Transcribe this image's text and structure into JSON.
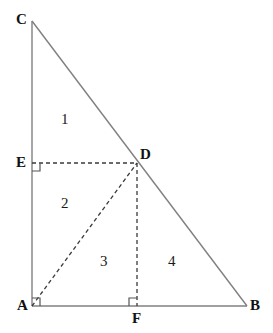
{
  "figure": {
    "background_color": "#ffffff",
    "width": 273,
    "height": 333,
    "solid_line_color": "#808080",
    "dashed_line_color": "#3a3a3a",
    "right_angle_marker_color": "#555555",
    "label_color": "#111111"
  },
  "points": [
    {
      "name": "C",
      "label": "C",
      "x": 32,
      "y": 21,
      "label_x": 16,
      "label_y": 12
    },
    {
      "name": "E",
      "label": "E",
      "x": 32,
      "y": 163,
      "label_x": 16,
      "label_y": 155
    },
    {
      "name": "A",
      "label": "A",
      "x": 32,
      "y": 306,
      "label_x": 17,
      "label_y": 298
    },
    {
      "name": "D",
      "label": "D",
      "x": 137,
      "y": 163,
      "label_x": 140,
      "label_y": 147
    },
    {
      "name": "F",
      "label": "F",
      "x": 137,
      "y": 306,
      "label_x": 132,
      "label_y": 311
    },
    {
      "name": "B",
      "label": "B",
      "x": 247,
      "y": 306,
      "label_x": 250,
      "label_y": 298
    }
  ],
  "solid_segments": [
    {
      "name": "segment-CA",
      "from": "C",
      "to": "A",
      "x1": 32,
      "y1": 21,
      "x2": 32,
      "y2": 306
    },
    {
      "name": "segment-AB",
      "from": "A",
      "to": "B",
      "x1": 32,
      "y1": 306,
      "x2": 247,
      "y2": 306
    },
    {
      "name": "segment-CB",
      "from": "C",
      "to": "B",
      "x1": 32,
      "y1": 21,
      "x2": 247,
      "y2": 306
    }
  ],
  "dashed_segments": [
    {
      "name": "segment-ED",
      "from": "E",
      "to": "D",
      "x1": 32,
      "y1": 163,
      "x2": 137,
      "y2": 163
    },
    {
      "name": "segment-AD",
      "from": "A",
      "to": "D",
      "x1": 32,
      "y1": 306,
      "x2": 137,
      "y2": 163
    },
    {
      "name": "segment-DF",
      "from": "D",
      "to": "F",
      "x1": 137,
      "y1": 163,
      "x2": 137,
      "y2": 306
    }
  ],
  "right_angle_markers": [
    {
      "name": "right-angle-at-E",
      "at": "E",
      "x": 32,
      "y": 163,
      "dx": 1,
      "dy": 1,
      "size": 8
    },
    {
      "name": "right-angle-at-A",
      "at": "A",
      "x": 32,
      "y": 306,
      "dx": 1,
      "dy": -1,
      "size": 8
    },
    {
      "name": "right-angle-at-F",
      "at": "F",
      "x": 137,
      "y": 306,
      "dx": -1,
      "dy": -1,
      "size": 8
    }
  ],
  "region_labels": [
    {
      "name": "region-1",
      "label": "1",
      "x": 61,
      "y": 112,
      "region": "triangle CED"
    },
    {
      "name": "region-2",
      "label": "2",
      "x": 61,
      "y": 196,
      "region": "triangle EAD"
    },
    {
      "name": "region-3",
      "label": "3",
      "x": 100,
      "y": 254,
      "region": "triangle ADF"
    },
    {
      "name": "region-4",
      "label": "4",
      "x": 168,
      "y": 254,
      "region": "triangle DFB"
    }
  ]
}
